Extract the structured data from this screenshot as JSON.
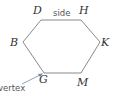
{
  "diagram": {
    "shape": "hexagon",
    "stroke_color": "#8a8a8a",
    "vertices": [
      {
        "label": "D",
        "x": 41,
        "y": 20,
        "lx": 33,
        "ly": 14
      },
      {
        "label": "H",
        "x": 81,
        "y": 20,
        "lx": 79,
        "ly": 14
      },
      {
        "label": "K",
        "x": 100,
        "y": 42,
        "lx": 101,
        "ly": 46
      },
      {
        "label": "M",
        "x": 81,
        "y": 73,
        "lx": 77,
        "ly": 86
      },
      {
        "label": "G",
        "x": 44,
        "y": 73,
        "lx": 39,
        "ly": 83
      },
      {
        "label": "B",
        "x": 23,
        "y": 42,
        "lx": 10,
        "ly": 46
      }
    ],
    "annotations": {
      "side": "side",
      "vertex": "vertex"
    }
  }
}
